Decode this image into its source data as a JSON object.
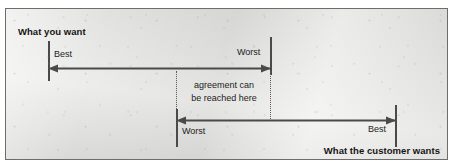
{
  "figure": {
    "type": "negotiation-range-diagram",
    "background_color": "#e2e2e0",
    "border_color": "#6d6d6d",
    "ink_color": "#4a4a4a",
    "text_color": "#1c1c1c"
  },
  "headings": {
    "your_side": "What you want",
    "customer_side": "What the customer wants"
  },
  "scales": {
    "top": {
      "name": "your-preference-scale",
      "left_label": "Best",
      "right_label": "Worst",
      "arrow_direction": "left",
      "start_x": 42,
      "end_x": 264
    },
    "bottom": {
      "name": "customer-preference-scale",
      "left_label": "Worst",
      "right_label": "Best",
      "arrow_direction": "left",
      "start_x": 170,
      "end_x": 389
    }
  },
  "overlap_zone": {
    "name": "agreement-zone",
    "annotation_line_1": "agreement can",
    "annotation_line_2": "be reached here",
    "left_boundary_x": 170,
    "right_boundary_x": 264,
    "boundary_style": "dotted"
  }
}
